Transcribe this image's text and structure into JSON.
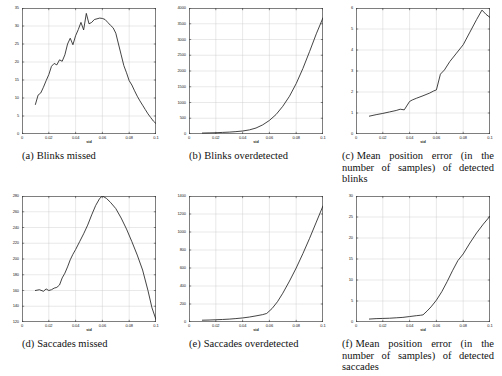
{
  "figure": {
    "xaxis_label": "std",
    "panels": [
      {
        "id": "a",
        "caption_label": "(a)",
        "caption_text": "Blinks missed",
        "caption_lines": [
          "Blinks missed"
        ],
        "centered": true
      },
      {
        "id": "b",
        "caption_label": "(b)",
        "caption_text": "Blinks overdetected",
        "caption_lines": [
          "Blinks overdetected"
        ],
        "centered": true
      },
      {
        "id": "c",
        "caption_label": "(c)",
        "caption_text": "Mean position error (in the number of samples) of detected blinks",
        "caption_lines": [
          "Mean position error (in the",
          "number of samples) of detected",
          "blinks"
        ],
        "centered": false
      },
      {
        "id": "d",
        "caption_label": "(d)",
        "caption_text": "Saccades missed",
        "caption_lines": [
          "Saccades missed"
        ],
        "centered": true
      },
      {
        "id": "e",
        "caption_label": "(e)",
        "caption_text": "Saccades overdetected",
        "caption_lines": [
          "Saccades overdetected"
        ],
        "centered": true
      },
      {
        "id": "f",
        "caption_label": "(f)",
        "caption_text": "Mean position error (in the number of samples) of detected saccades",
        "caption_lines": [
          "Mean position error (in the",
          "number of samples) of detected",
          "saccades"
        ],
        "centered": false
      }
    ]
  },
  "chart_data": [
    {
      "type": "line",
      "id": "a",
      "title": "Blinks missed",
      "xlabel": "std",
      "ylabel": "",
      "xlim": [
        0,
        0.1
      ],
      "ylim": [
        0,
        35
      ],
      "xticks": [
        0,
        0.02,
        0.04,
        0.06,
        0.08,
        0.1
      ],
      "xticklabels": [
        "0",
        "0.02",
        "0.04",
        "0.06",
        "0.08",
        "0.1"
      ],
      "yticks": [
        0,
        5,
        10,
        15,
        20,
        25,
        30,
        35
      ],
      "yticklabels": [
        "0",
        "5",
        "10",
        "15",
        "20",
        "25",
        "30",
        "35"
      ],
      "grid": true,
      "legend": "none",
      "x": [
        0.01,
        0.012,
        0.014,
        0.016,
        0.018,
        0.02,
        0.022,
        0.024,
        0.026,
        0.028,
        0.03,
        0.032,
        0.034,
        0.036,
        0.038,
        0.04,
        0.042,
        0.044,
        0.046,
        0.048,
        0.05,
        0.052,
        0.054,
        0.056,
        0.058,
        0.06,
        0.062,
        0.064,
        0.066,
        0.068,
        0.07,
        0.072,
        0.074,
        0.076,
        0.078,
        0.08,
        0.082,
        0.084,
        0.086,
        0.088,
        0.09,
        0.092,
        0.094,
        0.096,
        0.098,
        0.1
      ],
      "y": [
        8.2,
        10.8,
        11.4,
        13.0,
        14.8,
        16.5,
        18.8,
        19.6,
        19.2,
        20.6,
        20.2,
        22.0,
        25.0,
        26.6,
        24.8,
        27.3,
        29.0,
        31.0,
        28.9,
        33.5,
        30.6,
        31.0,
        31.8,
        32.0,
        32.2,
        32.1,
        31.8,
        31.0,
        30.2,
        29.5,
        28.0,
        25.0,
        22.0,
        19.0,
        17.0,
        14.8,
        13.6,
        12.0,
        10.5,
        9.2,
        8.0,
        6.8,
        5.6,
        4.6,
        3.6,
        2.9
      ]
    },
    {
      "type": "line",
      "id": "b",
      "title": "Blinks overdetected",
      "xlabel": "std",
      "ylabel": "",
      "xlim": [
        0,
        0.1
      ],
      "ylim": [
        0,
        4000
      ],
      "xticks": [
        0,
        0.02,
        0.04,
        0.06,
        0.08,
        0.1
      ],
      "xticklabels": [
        "0",
        "0.02",
        "0.04",
        "0.06",
        "0.08",
        "0.1"
      ],
      "yticks": [
        0,
        500,
        1000,
        1500,
        2000,
        2500,
        3000,
        3500,
        4000
      ],
      "yticklabels": [
        "0",
        "500",
        "1000",
        "1500",
        "2000",
        "2500",
        "3000",
        "3500",
        "4000"
      ],
      "grid": true,
      "legend": "none",
      "x": [
        0.01,
        0.015,
        0.02,
        0.025,
        0.03,
        0.035,
        0.04,
        0.045,
        0.05,
        0.055,
        0.06,
        0.065,
        0.07,
        0.075,
        0.08,
        0.085,
        0.09,
        0.095,
        0.1
      ],
      "y": [
        30,
        35,
        40,
        50,
        60,
        75,
        95,
        130,
        190,
        290,
        430,
        620,
        880,
        1200,
        1600,
        2080,
        2620,
        3180,
        3690
      ]
    },
    {
      "type": "line",
      "id": "c",
      "title": "Mean position error (in the number of samples) of detected blinks",
      "xlabel": "std",
      "ylabel": "",
      "xlim": [
        0,
        0.1
      ],
      "ylim": [
        0,
        6
      ],
      "xticks": [
        0,
        0.02,
        0.04,
        0.06,
        0.08,
        0.1
      ],
      "xticklabels": [
        "0",
        "0.02",
        "0.04",
        "0.06",
        "0.08",
        "0.1"
      ],
      "yticks": [
        0,
        1,
        2,
        3,
        4,
        5,
        6
      ],
      "yticklabels": [
        "0",
        "1",
        "2",
        "3",
        "4",
        "5",
        "6"
      ],
      "grid": true,
      "legend": "none",
      "x": [
        0.01,
        0.015,
        0.02,
        0.025,
        0.03,
        0.033,
        0.036,
        0.04,
        0.042,
        0.045,
        0.05,
        0.055,
        0.058,
        0.06,
        0.063,
        0.066,
        0.07,
        0.075,
        0.08,
        0.085,
        0.09,
        0.094,
        0.097,
        0.1
      ],
      "y": [
        0.85,
        0.92,
        0.98,
        1.05,
        1.12,
        1.18,
        1.15,
        1.55,
        1.62,
        1.7,
        1.82,
        1.95,
        2.05,
        2.1,
        2.85,
        3.05,
        3.45,
        3.85,
        4.25,
        4.85,
        5.45,
        5.9,
        5.7,
        5.55
      ]
    },
    {
      "type": "line",
      "id": "d",
      "title": "Saccades missed",
      "xlabel": "std",
      "ylabel": "",
      "xlim": [
        0,
        0.1
      ],
      "ylim": [
        120,
        280
      ],
      "xticks": [
        0,
        0.02,
        0.04,
        0.06,
        0.08,
        0.1
      ],
      "xticklabels": [
        "0",
        "0.02",
        "0.04",
        "0.06",
        "0.08",
        "0.1"
      ],
      "yticks": [
        120,
        140,
        160,
        180,
        200,
        220,
        240,
        260,
        280
      ],
      "yticklabels": [
        "120",
        "140",
        "160",
        "180",
        "200",
        "220",
        "240",
        "260",
        "280"
      ],
      "grid": true,
      "legend": "none",
      "x": [
        0.01,
        0.013,
        0.016,
        0.018,
        0.02,
        0.022,
        0.024,
        0.026,
        0.028,
        0.03,
        0.032,
        0.034,
        0.036,
        0.038,
        0.04,
        0.043,
        0.046,
        0.049,
        0.052,
        0.055,
        0.058,
        0.06,
        0.063,
        0.066,
        0.07,
        0.074,
        0.078,
        0.082,
        0.086,
        0.09,
        0.094,
        0.097,
        0.1
      ],
      "y": [
        160,
        161,
        159,
        162,
        160,
        161,
        163,
        164,
        167,
        176,
        182,
        190,
        199,
        206,
        212,
        222,
        232,
        243,
        256,
        268,
        277,
        280,
        277,
        272,
        264,
        252,
        238,
        222,
        205,
        186,
        160,
        138,
        123
      ]
    },
    {
      "type": "line",
      "id": "e",
      "title": "Saccades overdetected",
      "xlabel": "std",
      "ylabel": "",
      "xlim": [
        0,
        0.1
      ],
      "ylim": [
        0,
        1400
      ],
      "xticks": [
        0,
        0.02,
        0.04,
        0.06,
        0.08,
        0.1
      ],
      "xticklabels": [
        "0",
        "0.02",
        "0.04",
        "0.06",
        "0.08",
        "0.1"
      ],
      "yticks": [
        0,
        200,
        400,
        600,
        800,
        1000,
        1200,
        1400
      ],
      "yticklabels": [
        "0",
        "200",
        "400",
        "600",
        "800",
        "1000",
        "1200",
        "1400"
      ],
      "grid": true,
      "legend": "none",
      "x": [
        0.01,
        0.015,
        0.02,
        0.025,
        0.03,
        0.035,
        0.04,
        0.045,
        0.05,
        0.055,
        0.058,
        0.062,
        0.066,
        0.07,
        0.075,
        0.08,
        0.085,
        0.09,
        0.095,
        0.1
      ],
      "y": [
        20,
        22,
        25,
        28,
        32,
        38,
        45,
        55,
        68,
        82,
        95,
        150,
        225,
        320,
        455,
        600,
        760,
        930,
        1110,
        1290
      ]
    },
    {
      "type": "line",
      "id": "f",
      "title": "Mean position error (in the number of samples) of detected saccades",
      "xlabel": "std",
      "ylabel": "",
      "xlim": [
        0,
        0.1
      ],
      "ylim": [
        0,
        30
      ],
      "xticks": [
        0,
        0.02,
        0.04,
        0.06,
        0.08,
        0.1
      ],
      "xticklabels": [
        "0",
        "0.02",
        "0.04",
        "0.06",
        "0.08",
        "0.1"
      ],
      "yticks": [
        0,
        5,
        10,
        15,
        20,
        25,
        30
      ],
      "yticklabels": [
        "0",
        "5",
        "10",
        "15",
        "20",
        "25",
        "30"
      ],
      "grid": true,
      "legend": "none",
      "x": [
        0.01,
        0.015,
        0.02,
        0.025,
        0.03,
        0.035,
        0.04,
        0.045,
        0.048,
        0.05,
        0.053,
        0.056,
        0.06,
        0.064,
        0.068,
        0.072,
        0.076,
        0.08,
        0.085,
        0.09,
        0.095,
        0.1
      ],
      "y": [
        0.7,
        0.8,
        0.85,
        0.9,
        1.0,
        1.1,
        1.3,
        1.5,
        1.6,
        1.7,
        2.6,
        3.6,
        5.2,
        7.2,
        9.6,
        12.2,
        14.6,
        16.2,
        18.8,
        21.2,
        23.3,
        25.2
      ]
    }
  ]
}
